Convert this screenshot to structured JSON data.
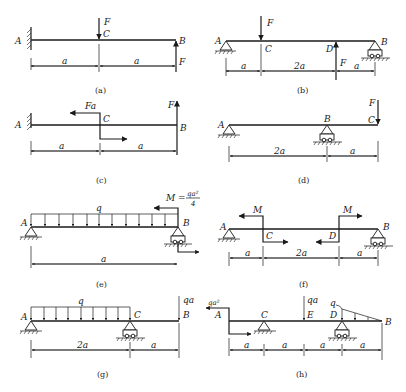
{
  "figure": {
    "panels": [
      {
        "caption": "(a)",
        "support": "fixed at A",
        "points": [
          "A",
          "C",
          "B"
        ],
        "loads": [
          {
            "type": "force",
            "label": "F",
            "at": "C",
            "direction": "down"
          },
          {
            "type": "force",
            "label": "F",
            "at": "B",
            "direction": "up"
          }
        ],
        "dims": [
          "a",
          "a"
        ]
      },
      {
        "caption": "(b)",
        "support": "pin at A, roller at B",
        "points": [
          "A",
          "C",
          "D",
          "B"
        ],
        "loads": [
          {
            "type": "force",
            "label": "F",
            "at": "C",
            "direction": "down"
          },
          {
            "type": "force",
            "label": "F",
            "at": "D",
            "direction": "up"
          }
        ],
        "dims": [
          "a",
          "2a",
          "a"
        ]
      },
      {
        "caption": "(c)",
        "support": "fixed at A",
        "points": [
          "A",
          "C",
          "B"
        ],
        "loads": [
          {
            "type": "moment",
            "label": "Fa",
            "at": "C"
          },
          {
            "type": "force",
            "label": "F",
            "at": "B",
            "direction": "up"
          }
        ],
        "dims": [
          "a",
          "a"
        ]
      },
      {
        "caption": "(d)",
        "support": "pin at A, roller at B",
        "points": [
          "A",
          "B",
          "C"
        ],
        "loads": [
          {
            "type": "force",
            "label": "F",
            "at": "C",
            "direction": "down"
          }
        ],
        "dims": [
          "2a",
          "a"
        ]
      },
      {
        "caption": "(e)",
        "support": "pin at A, roller at B",
        "points": [
          "A",
          "B"
        ],
        "loads": [
          {
            "type": "distributed",
            "label": "q",
            "from": "A",
            "to": "B"
          },
          {
            "type": "moment",
            "label": "M",
            "value_num": "qa²",
            "value_den": "4",
            "at": "B"
          }
        ],
        "dims": [
          "a"
        ]
      },
      {
        "caption": "(f)",
        "support": "pin at A, roller at B",
        "points": [
          "A",
          "C",
          "D",
          "B"
        ],
        "loads": [
          {
            "type": "moment",
            "label": "M",
            "at": "C"
          },
          {
            "type": "moment",
            "label": "M",
            "at": "D"
          }
        ],
        "dims": [
          "a",
          "2a",
          "a"
        ]
      },
      {
        "caption": "(g)",
        "support": "pin at A, roller at C",
        "points": [
          "A",
          "C",
          "B"
        ],
        "loads": [
          {
            "type": "distributed",
            "label": "q",
            "from": "A",
            "to": "C"
          },
          {
            "type": "force",
            "label": "qa",
            "at": "B",
            "direction": "down"
          }
        ],
        "dims": [
          "2a",
          "a"
        ]
      },
      {
        "caption": "(h)",
        "support": "pin at C, roller at D",
        "points": [
          "A",
          "C",
          "E",
          "D",
          "B"
        ],
        "loads": [
          {
            "type": "moment",
            "label": "qa²",
            "at": "A"
          },
          {
            "type": "force",
            "label": "qa",
            "at": "E",
            "direction": "down"
          },
          {
            "type": "triangular",
            "label": "q",
            "from": "D",
            "to": "B"
          }
        ],
        "dims": [
          "a",
          "a",
          "a",
          "a"
        ]
      }
    ]
  },
  "labels": {
    "A": "A",
    "B": "B",
    "C": "C",
    "D": "D",
    "E": "E",
    "F": "F",
    "Fa": "Fa",
    "q": "q",
    "qa": "qa",
    "qa2": "qa²",
    "M": "M",
    "Meq": "M =",
    "qa2frac": "qa²",
    "four": "4",
    "a": "a",
    "a2": "2a",
    "cap_a": "(a)",
    "cap_b": "(b)",
    "cap_c": "(c)",
    "cap_d": "(d)",
    "cap_e": "(e)",
    "cap_f": "(f)",
    "cap_g": "(g)",
    "cap_h": "(h)"
  }
}
